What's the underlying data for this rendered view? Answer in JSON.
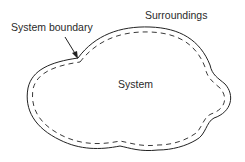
{
  "diagram": {
    "labels": {
      "system_boundary": "System boundary",
      "surroundings": "Surroundings",
      "system": "System"
    },
    "colors": {
      "outline": "#222222",
      "text": "#2a2a2a",
      "background": "#ffffff"
    }
  }
}
